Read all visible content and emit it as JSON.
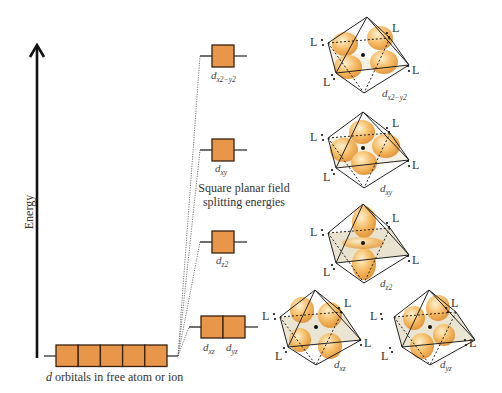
{
  "diagram": {
    "axis": {
      "label": "Energy"
    },
    "free_ion": {
      "caption": "d orbitals in free atom or ion",
      "caption_italic": "d",
      "caption_rest": " orbitals in free atom or ion",
      "orbital_count": 5
    },
    "split_caption": {
      "line1": "Square planar field",
      "line2": "splitting energies"
    },
    "levels": [
      {
        "id": "dx2-y2",
        "label_base": "d",
        "label_sub": "x2−y2",
        "boxes": 1
      },
      {
        "id": "dxy",
        "label_base": "d",
        "label_sub": "xy",
        "boxes": 1
      },
      {
        "id": "dz2",
        "label_base": "d",
        "label_sub": "z2",
        "boxes": 1
      },
      {
        "id": "dxz-dyz",
        "labels": [
          {
            "base": "d",
            "sub": "xz"
          },
          {
            "base": "d",
            "sub": "yz"
          }
        ],
        "boxes": 2
      }
    ],
    "ligand_label": "L",
    "octahedra": [
      {
        "orbital": "dx2-y2",
        "label_base": "d",
        "label_sub": "x2−y2"
      },
      {
        "orbital": "dxy",
        "label_base": "d",
        "label_sub": "xy"
      },
      {
        "orbital": "dz2",
        "label_base": "d",
        "label_sub": "z2"
      },
      {
        "orbital": "dxz",
        "label_base": "d",
        "label_sub": "xz"
      },
      {
        "orbital": "dyz",
        "label_base": "d",
        "label_sub": "yz"
      }
    ],
    "colors": {
      "orbital_fill": "#e8964a",
      "orbital_stroke": "#3a2210",
      "lobe": "#f0a540",
      "lobe_light": "#fde3a8",
      "plane": "#d9d0b0"
    }
  }
}
